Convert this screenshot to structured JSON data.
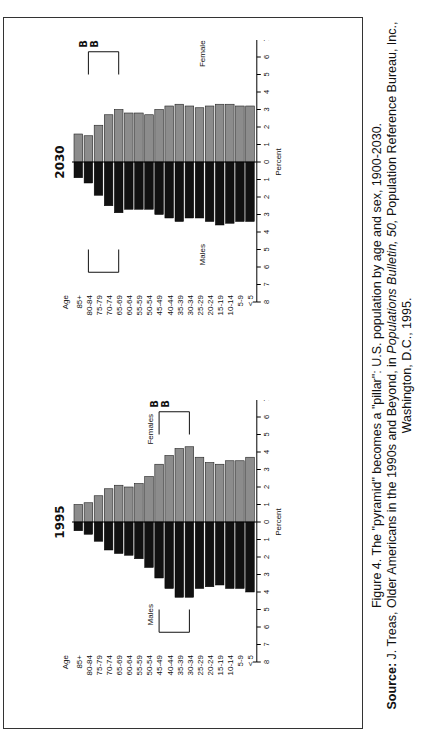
{
  "figure": {
    "caption_line1": "Figure 4.  The \"pyramid\" becomes a \"pillar\": U.S. population by age and sex, 1900-2030.",
    "source_label": "Source:",
    "source_text_a": "J. Treas, Older Americans in the 1990s and Beyond, in ",
    "source_italic": "Populations Bulletin, 50,",
    "source_text_b": " Population Reference Bureau, Inc.,",
    "source_line3": "Washington, D.C., 1995."
  },
  "colors": {
    "females": "#8c8c8c",
    "males": "#111111",
    "frame": "#333333"
  },
  "chart_data": [
    {
      "type": "bar",
      "subtype": "population-pyramid",
      "title": "1995",
      "xlabel": "Percent",
      "ylabel": "Age",
      "xlim": [
        -8,
        8
      ],
      "x_ticks": [
        "8",
        "7",
        "6",
        "5",
        "4",
        "3",
        "2",
        "1",
        "0",
        "1",
        "2",
        "3",
        "4",
        "5",
        "6",
        "7",
        "8"
      ],
      "categories": [
        "85+",
        "80-84",
        "75-79",
        "70-74",
        "65-69",
        "60-64",
        "55-59",
        "50-54",
        "45-49",
        "40-44",
        "35-39",
        "30-34",
        "25-29",
        "20-24",
        "15-19",
        "10-14",
        "5-9",
        "< 5"
      ],
      "series": [
        {
          "name": "Males",
          "values": [
            0.5,
            0.7,
            1.1,
            1.6,
            1.8,
            1.9,
            2.1,
            2.6,
            3.2,
            3.8,
            4.3,
            4.3,
            3.8,
            3.7,
            3.6,
            3.8,
            3.8,
            4.0
          ]
        },
        {
          "name": "Females",
          "values": [
            1.0,
            1.1,
            1.5,
            1.9,
            2.1,
            2.0,
            2.2,
            2.6,
            3.3,
            3.8,
            4.2,
            4.3,
            3.7,
            3.4,
            3.3,
            3.5,
            3.5,
            3.7
          ]
        }
      ],
      "annotations": [
        {
          "text": "Baby Boom",
          "span": [
            "45-49",
            "30-34"
          ]
        }
      ],
      "legend": [
        "Males",
        "Females"
      ]
    },
    {
      "type": "bar",
      "subtype": "population-pyramid",
      "title": "2030",
      "xlabel": "Percent",
      "ylabel": "Age",
      "xlim": [
        -8,
        8
      ],
      "x_ticks": [
        "8",
        "7",
        "6",
        "5",
        "4",
        "3",
        "2",
        "1",
        "0",
        "1",
        "2",
        "3",
        "4",
        "5",
        "6",
        "7",
        "8"
      ],
      "categories": [
        "85+",
        "80-84",
        "75-79",
        "70-74",
        "65-69",
        "60-64",
        "55-59",
        "50-54",
        "45-49",
        "40-44",
        "35-39",
        "30-34",
        "25-29",
        "20-24",
        "15-19",
        "10-14",
        "5-9",
        "< 5"
      ],
      "series": [
        {
          "name": "Males",
          "values": [
            0.9,
            1.2,
            1.9,
            2.5,
            2.9,
            2.7,
            2.7,
            2.7,
            3.0,
            3.2,
            3.4,
            3.2,
            3.2,
            3.4,
            3.6,
            3.5,
            3.4,
            3.4
          ]
        },
        {
          "name": "Females",
          "values": [
            1.6,
            1.5,
            2.1,
            2.7,
            3.0,
            2.8,
            2.8,
            2.7,
            3.0,
            3.2,
            3.3,
            3.2,
            3.1,
            3.2,
            3.3,
            3.3,
            3.2,
            3.2
          ]
        }
      ],
      "annotations": [
        {
          "text": "Baby Boom",
          "span": [
            "80-84",
            "65-69"
          ]
        }
      ],
      "legend": [
        "Males",
        "Females"
      ]
    }
  ]
}
